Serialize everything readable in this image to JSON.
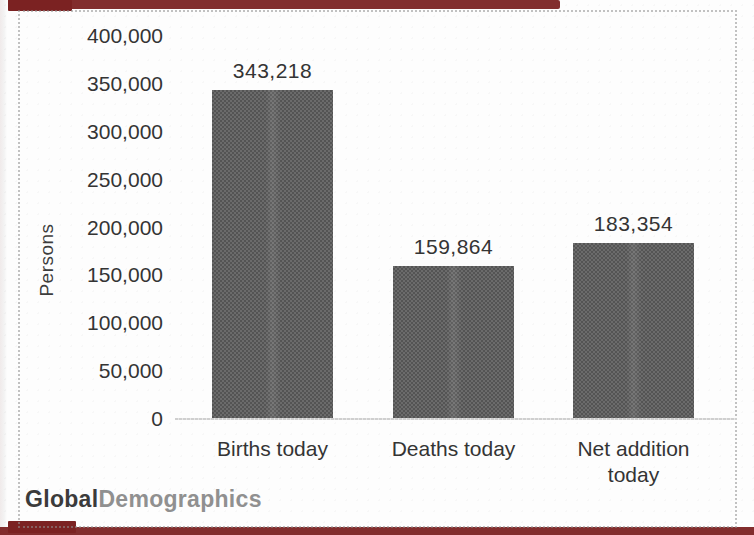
{
  "watermark": {
    "bold": "Global",
    "light": "Demographics"
  },
  "colors": {
    "bar": "#5f5f5f",
    "page_edge_red": "#7b2222",
    "axis_line": "#cfcfcf",
    "frame_border": "#919191",
    "text": "#343434",
    "watermark_bold": "#3b3b3b",
    "watermark_light": "#909090"
  },
  "chart_data": {
    "type": "bar",
    "title": "",
    "xlabel": "",
    "ylabel": "Persons",
    "categories": [
      "Births today",
      "Deaths today",
      "Net addition today"
    ],
    "values": [
      343218,
      159864,
      183354
    ],
    "value_labels": [
      "343,218",
      "159,864",
      "183,354"
    ],
    "ylim": [
      0,
      400000
    ],
    "ytick_values": [
      0,
      50000,
      100000,
      150000,
      200000,
      250000,
      300000,
      350000,
      400000
    ],
    "ytick_labels": [
      "0",
      "50,000",
      "100,000",
      "150,000",
      "200,000",
      "250,000",
      "300,000",
      "350,000",
      "400,000"
    ],
    "grid": false,
    "legend_shown": false,
    "bar_color_hex": "#5f5f5f",
    "source_watermark": "GlobalDemographics"
  }
}
